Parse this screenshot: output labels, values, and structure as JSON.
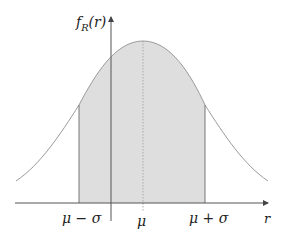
{
  "diagram": {
    "y_axis_label": {
      "func": "f",
      "subscript": "R",
      "arg": "(r)"
    },
    "x_axis_label": "r",
    "tick_labels": {
      "mu_minus_sigma": "μ − σ",
      "mu": "μ",
      "mu_plus_sigma": "μ + σ"
    },
    "colors": {
      "curve": "#9a9a9a",
      "fill": "#dedede",
      "axis": "#555555",
      "bounds": "#777777",
      "mean_line": "#aaaaaa"
    }
  }
}
